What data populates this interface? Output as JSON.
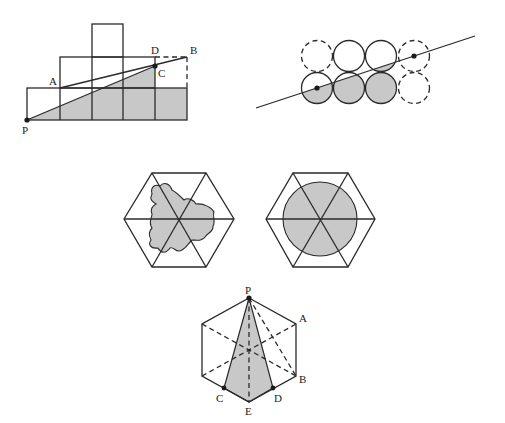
{
  "figures": [
    {
      "id": "staircase-grid",
      "description": "Staircase of unit squares with diagonal from P; shaded region below line PC and in the bottom row",
      "labels": {
        "A": "A",
        "B": "B",
        "C": "C",
        "D": "D",
        "P": "P"
      }
    },
    {
      "id": "circle-array",
      "description": "2x4 array of circles cut by a line through two centers; outer circles dashed; region below line shaded",
      "points_marked": 2
    },
    {
      "id": "hexagon-blob",
      "description": "Regular hexagon divided into 6 triangles with an irregular shaded region centered on the hexagon center"
    },
    {
      "id": "hexagon-circle",
      "description": "Regular hexagon divided into 6 triangles with a shaded inscribed circle"
    },
    {
      "id": "hexagon-triangle",
      "description": "Pointy-top hexagon with dashed diagonals; shaded quadrilateral PCED",
      "labels": {
        "P": "P",
        "A": "A",
        "B": "B",
        "C": "C",
        "D": "D",
        "E": "E"
      }
    }
  ],
  "colors": {
    "line": "#2a2a2a",
    "shade": "#c8c8c8",
    "background": "#ffffff"
  }
}
